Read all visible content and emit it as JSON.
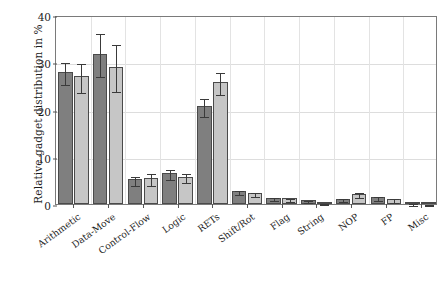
{
  "chart_data": {
    "type": "bar",
    "title": "",
    "xlabel": "",
    "ylabel": "Relative gadget distribution in %",
    "ylim": [
      0,
      40
    ],
    "yticks": [
      0,
      10,
      20,
      30,
      40
    ],
    "grid": true,
    "legend": "none",
    "categories": [
      "Arithmetic",
      "Data-Move",
      "Control-Flow",
      "Logic",
      "RETs",
      "Shift/Rot",
      "Flag",
      "String",
      "NOP",
      "FP",
      "Misc"
    ],
    "series": [
      {
        "name": "series-1",
        "color": "#7f7f7f",
        "values": [
          28.0,
          31.8,
          5.2,
          6.5,
          20.7,
          2.8,
          1.3,
          0.8,
          1.1,
          1.5,
          0.3
        ],
        "errors": [
          2.3,
          4.6,
          0.9,
          1.1,
          1.9,
          0.4,
          0.3,
          0.2,
          0.3,
          0.4,
          0.2
        ]
      },
      {
        "name": "series-2",
        "color": "#c6c6c6",
        "values": [
          27.0,
          29.1,
          5.5,
          5.8,
          25.8,
          2.3,
          1.2,
          0.3,
          2.2,
          1.0,
          0.1
        ],
        "errors": [
          3.0,
          5.0,
          1.3,
          0.9,
          2.3,
          0.4,
          0.3,
          0.1,
          0.5,
          0.4,
          0.1
        ]
      }
    ]
  }
}
